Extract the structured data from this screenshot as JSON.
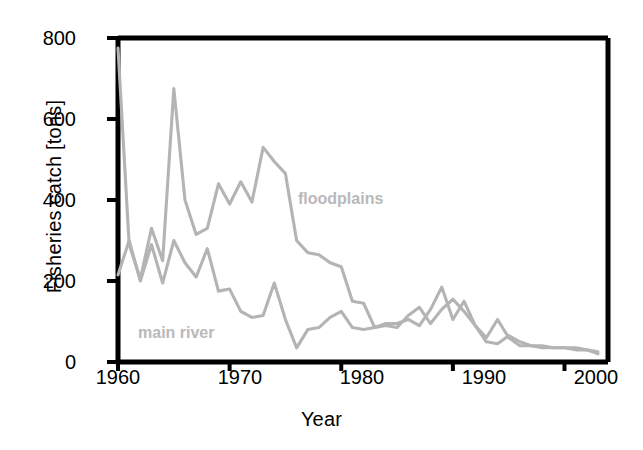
{
  "chart_data": {
    "type": "line",
    "title": "",
    "xlabel": "Year",
    "ylabel": "Fisheries catch [tons]",
    "xlim": [
      1960,
      2003
    ],
    "ylim": [
      0,
      800
    ],
    "xticks": [
      1960,
      1970,
      1980,
      1990,
      2000
    ],
    "yticks": [
      0,
      200,
      400,
      600,
      800
    ],
    "grid": false,
    "legend_position": "inline-annotation",
    "line_color": "#b4b4b4",
    "axis_color": "#000000",
    "annotations": [
      {
        "text": "floodplains",
        "x": 1980,
        "y": 390
      },
      {
        "text": "main river",
        "x": 1962,
        "y": 90
      }
    ],
    "x": [
      1960,
      1961,
      1962,
      1963,
      1964,
      1965,
      1966,
      1967,
      1968,
      1969,
      1970,
      1971,
      1972,
      1973,
      1974,
      1975,
      1976,
      1977,
      1978,
      1979,
      1980,
      1981,
      1982,
      1983,
      1984,
      1985,
      1986,
      1987,
      1988,
      1989,
      1990,
      1991,
      1992,
      1993,
      1994,
      1995,
      1996,
      1997,
      1998,
      1999,
      2000,
      2001,
      2002,
      2003
    ],
    "series": [
      {
        "name": "floodplains",
        "values": [
          775,
          290,
          205,
          330,
          250,
          675,
          400,
          315,
          330,
          440,
          390,
          445,
          395,
          530,
          495,
          465,
          300,
          270,
          265,
          245,
          235,
          150,
          145,
          85,
          95,
          95,
          105,
          90,
          130,
          185,
          105,
          150,
          90,
          60,
          105,
          60,
          40,
          40,
          35,
          35,
          35,
          35,
          30,
          20
        ]
      },
      {
        "name": "main river",
        "values": [
          215,
          300,
          200,
          290,
          195,
          300,
          245,
          210,
          280,
          175,
          180,
          125,
          110,
          115,
          195,
          105,
          35,
          80,
          85,
          110,
          125,
          85,
          80,
          85,
          90,
          85,
          115,
          135,
          95,
          130,
          155,
          125,
          90,
          50,
          45,
          65,
          50,
          40,
          40,
          35,
          35,
          30,
          30,
          25
        ]
      }
    ]
  },
  "axis_labels": {
    "y_title": "Fisheries catch [tons]",
    "x_title": "Year",
    "y_ticks": [
      "800",
      "600",
      "400",
      "200",
      "0"
    ],
    "x_ticks": [
      "1960",
      "1970",
      "1980",
      "1990",
      "2000"
    ]
  },
  "series_tags": {
    "floodplains": "floodplains",
    "main_river": "main river"
  }
}
